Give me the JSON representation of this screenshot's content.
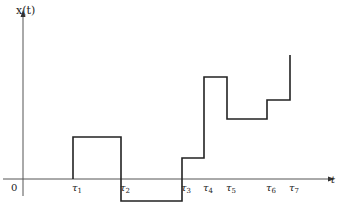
{
  "diagram": {
    "y_axis_label": "x(t)",
    "x_axis_label": "t",
    "origin_label": "0",
    "colors": {
      "axis": "#555555",
      "signal": "#222222",
      "text": "#222222"
    },
    "axes": {
      "origin": [
        23,
        179
      ],
      "x_axis": {
        "x1": 3,
        "x2": 328,
        "y": 179
      },
      "y_axis": {
        "x": 23,
        "y1": 196,
        "y2": 16
      }
    },
    "ticks": [
      {
        "label": "τ1",
        "sym": "τ",
        "sub": "1",
        "x": 73
      },
      {
        "label": "τ2",
        "sym": "τ",
        "sub": "2",
        "x": 121
      },
      {
        "label": "τ3",
        "sym": "τ",
        "sub": "3",
        "x": 182
      },
      {
        "label": "τ4",
        "sym": "τ",
        "sub": "4",
        "x": 204
      },
      {
        "label": "τ5",
        "sym": "τ",
        "sub": "5",
        "x": 227
      },
      {
        "label": "τ6",
        "sym": "τ",
        "sub": "6",
        "x": 267
      },
      {
        "label": "τ7",
        "sym": "τ",
        "sub": "7",
        "x": 290
      }
    ],
    "signal_points": [
      [
        73,
        179
      ],
      [
        73,
        137
      ],
      [
        121,
        137
      ],
      [
        121,
        201
      ],
      [
        182,
        201
      ],
      [
        182,
        158
      ],
      [
        204,
        158
      ],
      [
        204,
        77
      ],
      [
        227,
        77
      ],
      [
        227,
        119
      ],
      [
        267,
        119
      ],
      [
        267,
        100
      ],
      [
        290,
        100
      ],
      [
        290,
        55
      ]
    ]
  }
}
